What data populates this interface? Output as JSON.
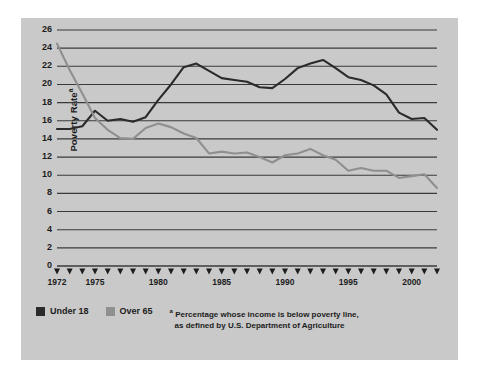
{
  "chart_data": {
    "type": "line",
    "title": "",
    "xlabel": "",
    "ylabel": "Poverty Rate",
    "ylabel_superscript": "a",
    "xlim": [
      1972,
      2002
    ],
    "ylim": [
      0,
      26
    ],
    "ytick_step": 2,
    "yticks": [
      0,
      2,
      4,
      6,
      8,
      10,
      12,
      14,
      16,
      18,
      20,
      22,
      24,
      26
    ],
    "xticks": [
      1972,
      1973,
      1974,
      1975,
      1976,
      1977,
      1978,
      1979,
      1980,
      1981,
      1982,
      1983,
      1984,
      1985,
      1986,
      1987,
      1988,
      1989,
      1990,
      1991,
      1992,
      1993,
      1994,
      1995,
      1996,
      1997,
      1998,
      1999,
      2000,
      2001,
      2002
    ],
    "xtick_labels": [
      {
        "value": 1972,
        "label": "1972"
      },
      {
        "value": 1975,
        "label": "1975"
      },
      {
        "value": 1980,
        "label": "1980"
      },
      {
        "value": 1985,
        "label": "1985"
      },
      {
        "value": 1990,
        "label": "1990"
      },
      {
        "value": 1995,
        "label": "1995"
      },
      {
        "value": 2000,
        "label": "2000"
      }
    ],
    "grid": "horizontal",
    "legend_position": "bottom-left",
    "x": [
      1972,
      1973,
      1974,
      1975,
      1976,
      1977,
      1978,
      1979,
      1980,
      1981,
      1982,
      1983,
      1984,
      1985,
      1986,
      1987,
      1988,
      1989,
      1990,
      1991,
      1992,
      1993,
      1994,
      1995,
      1996,
      1997,
      1998,
      1999,
      2000,
      2001,
      2002
    ],
    "series": [
      {
        "name": "Under 18",
        "color": "#2b2b2b",
        "values": [
          15.1,
          15.1,
          15.4,
          17.1,
          16.0,
          16.2,
          15.9,
          16.4,
          18.3,
          20.0,
          21.9,
          22.3,
          21.5,
          20.7,
          20.5,
          20.3,
          19.7,
          19.6,
          20.6,
          21.8,
          22.3,
          22.7,
          21.8,
          20.8,
          20.5,
          19.9,
          18.9,
          16.9,
          16.2,
          16.3,
          15.0
        ]
      },
      {
        "name": "Over 65",
        "color": "#8f8f8f",
        "values": [
          24.5,
          21.6,
          19.0,
          16.3,
          15.0,
          14.1,
          14.0,
          15.2,
          15.7,
          15.3,
          14.6,
          14.1,
          12.4,
          12.6,
          12.4,
          12.5,
          12.0,
          11.4,
          12.2,
          12.4,
          12.9,
          12.2,
          11.7,
          10.5,
          10.8,
          10.5,
          10.5,
          9.7,
          9.9,
          10.1,
          8.6
        ]
      }
    ]
  },
  "legend": {
    "items": [
      {
        "label": "Under 18",
        "swatch": "under"
      },
      {
        "label": "Over 65",
        "swatch": "over"
      }
    ]
  },
  "footnote": {
    "marker": "a",
    "line1": "Percentage whose income is below poverty line,",
    "line2": "as defined by U.S. Department of Agriculture"
  }
}
